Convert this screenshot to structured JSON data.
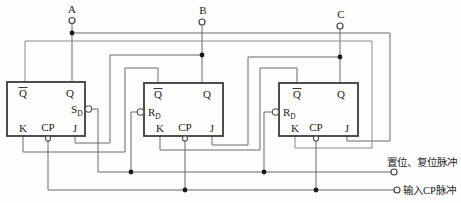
{
  "terminals": {
    "a": "A",
    "b": "B",
    "c": "C"
  },
  "annotations": {
    "set_reset_label": "置位、复位脉冲",
    "cp_input_label": "输入CP脉冲"
  },
  "flipflops": [
    {
      "id": "ff1",
      "qbar": "Q",
      "q": "Q",
      "preset_main": "S",
      "preset_sub": "D",
      "k": "K",
      "cp": "CP",
      "j": "J"
    },
    {
      "id": "ff2",
      "qbar": "Q",
      "q": "Q",
      "preset_main": "R",
      "preset_sub": "D",
      "k": "K",
      "cp": "CP",
      "j": "J"
    },
    {
      "id": "ff3",
      "qbar": "Q",
      "q": "Q",
      "preset_main": "R",
      "preset_sub": "D",
      "k": "K",
      "cp": "CP",
      "j": "J"
    }
  ],
  "colors": {
    "wire": "#6b6b6b",
    "box": "#3c3c3c",
    "text": "#222222",
    "background": "#fdfdfc"
  }
}
